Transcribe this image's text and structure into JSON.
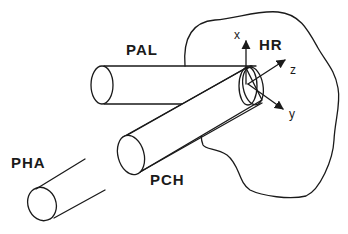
{
  "diagram": {
    "labels": {
      "pal": "PAL",
      "pch": "PCH",
      "pha": "PHA",
      "hr": "HR"
    },
    "axes": {
      "x": "x",
      "y": "y",
      "z": "z"
    },
    "colors": {
      "ink": "#1a1a1a",
      "background": "#ffffff"
    }
  }
}
